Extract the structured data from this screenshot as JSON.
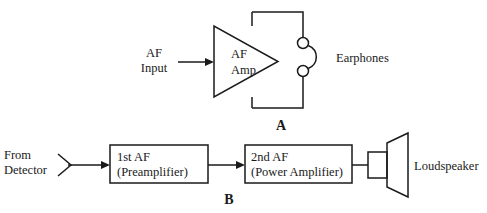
{
  "figure": {
    "background_color": "#ffffff",
    "line_color": "#1a1a1a"
  },
  "panel_a": {
    "letter": "A",
    "input_label_line1": "AF",
    "input_label_line2": "Input",
    "amplifier_label_line1": "AF",
    "amplifier_label_line2": "Amp",
    "output_label": "Earphones",
    "symbols": {
      "amplifier": "triangle-amplifier-symbol",
      "output_device": "earphones-symbol",
      "signal_flow": "arrow-right"
    }
  },
  "panel_b": {
    "letter": "B",
    "source_label_line1": "From",
    "source_label_line2": "Detector",
    "stage1_line1": "1st AF",
    "stage1_line2": "(Preamplifier)",
    "stage2_line1": "2nd AF",
    "stage2_line2": "(Power Amplifier)",
    "output_label": "Loudspeaker",
    "symbols": {
      "break": "chevron-wire-break-symbol",
      "output_device": "loudspeaker-symbol",
      "signal_flow": "arrow-right"
    }
  }
}
